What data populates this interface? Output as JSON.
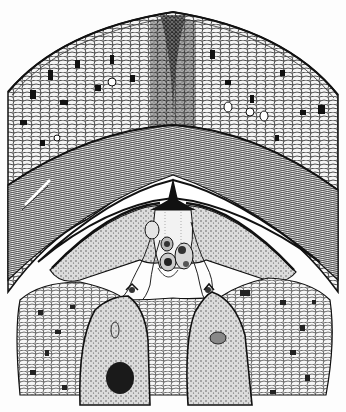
{
  "figure": {
    "background_color": "#fdfdfd",
    "ink_color": "#1a1a1a",
    "regions": [
      {
        "name": "nucellus-apex-dome",
        "description": "outer dome of reticulate cellular tissue with dark inclusions"
      },
      {
        "name": "integument-fibrous-band",
        "description": "arched band of elongated wavy cells"
      },
      {
        "name": "pollen-chamber",
        "description": "white crescent cavity"
      },
      {
        "name": "central-beak",
        "description": "dark spike with pollen tubes and grains"
      },
      {
        "name": "pollen-grains",
        "count": 3
      },
      {
        "name": "lower-cellular-tissue",
        "description": "prothallus tissue with dark granules"
      },
      {
        "name": "archegonia",
        "count": 2
      }
    ]
  }
}
